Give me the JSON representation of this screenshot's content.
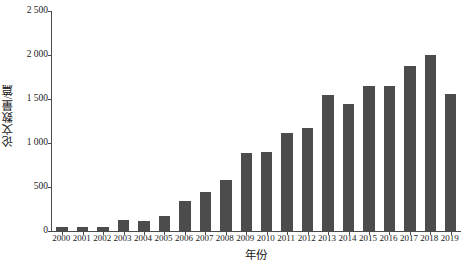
{
  "chart_data": {
    "type": "bar",
    "title": "",
    "subtitle": "",
    "xlabel": "年份",
    "ylabel": "论文数量/篇",
    "categories": [
      "2000",
      "2001",
      "2002",
      "2003",
      "2004",
      "2005",
      "2006",
      "2007",
      "2008",
      "2009",
      "2010",
      "2011",
      "2012",
      "2013",
      "2014",
      "2015",
      "2016",
      "2017",
      "2018",
      "2019"
    ],
    "values": [
      50,
      40,
      50,
      120,
      115,
      175,
      340,
      440,
      575,
      890,
      900,
      1110,
      1170,
      1550,
      1440,
      1650,
      1650,
      1870,
      2000,
      1560
    ],
    "series": [
      {
        "name": "论文数量",
        "values": [
          50,
          40,
          50,
          120,
          115,
          175,
          340,
          440,
          575,
          890,
          900,
          1110,
          1170,
          1550,
          1440,
          1650,
          1650,
          1870,
          2000,
          1560
        ]
      }
    ],
    "ylim": [
      0,
      2500
    ],
    "yticks": [
      0,
      500,
      1000,
      1500,
      2000,
      2500
    ],
    "ytick_labels": [
      "0",
      "500",
      "1 000",
      "1 500",
      "2 000",
      "2 500"
    ],
    "xtick_labels": [
      "2000",
      "2001",
      "2002",
      "2003",
      "2004",
      "2005",
      "2006",
      "2007",
      "2008",
      "2009",
      "2010",
      "2011",
      "2012",
      "2013",
      "2014",
      "2015",
      "2016",
      "2017",
      "2018",
      "2019"
    ],
    "grid": false,
    "legend": null,
    "legend_position": "none",
    "bar_color": "#4c4c4c",
    "axis_color": "#4a4a4a",
    "background_color": "#ffffff"
  }
}
